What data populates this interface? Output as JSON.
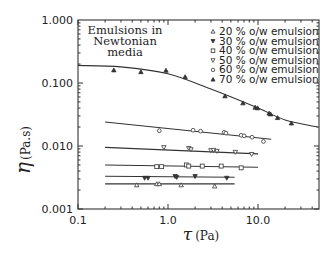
{
  "chart_data": {
    "type": "scatter",
    "title": "",
    "annotation": [
      "Emulsions in",
      "Newtonian",
      "media"
    ],
    "xlabel": "τ (Pa)",
    "ylabel": "η (Pa.s)",
    "xscale": "log",
    "yscale": "log",
    "xlim": [
      0.1,
      46
    ],
    "ylim": [
      0.001,
      1.0
    ],
    "xticks": [
      "0.1",
      "1.0",
      "10.0"
    ],
    "yticks": [
      "1.000",
      "0.100",
      "0.010",
      "0.001"
    ],
    "grid": false,
    "legend_position": "upper right",
    "series": [
      {
        "name": "20 % o/w emulsion",
        "marker": "triangle-open",
        "x": [
          0.45,
          0.75,
          0.8,
          1.4,
          3.3
        ],
        "y": [
          0.0024,
          0.0025,
          0.0025,
          0.0024,
          0.0023
        ],
        "fit": {
          "x": [
            0.2,
            5.5
          ],
          "y": [
            0.0025,
            0.0025
          ]
        }
      },
      {
        "name": "30 % o/w emulsion",
        "marker": "triangle-down-filled",
        "x": [
          0.55,
          0.6,
          1.2,
          1.25,
          2.0,
          4.5
        ],
        "y": [
          0.0031,
          0.0031,
          0.0033,
          0.0032,
          0.0033,
          0.0031
        ],
        "fit": {
          "x": [
            0.2,
            5.5
          ],
          "y": [
            0.0033,
            0.0032
          ]
        }
      },
      {
        "name": "40 % o/w emulsion",
        "marker": "square-open",
        "x": [
          0.75,
          0.85,
          1.6,
          1.7,
          2.4,
          3.9,
          6.5
        ],
        "y": [
          0.0047,
          0.0047,
          0.005,
          0.0048,
          0.0048,
          0.0048,
          0.0045
        ],
        "fit": {
          "x": [
            0.2,
            10
          ],
          "y": [
            0.005,
            0.0046
          ]
        }
      },
      {
        "name": "50 % o/w emulsion",
        "marker": "triangle-down-open",
        "x": [
          0.9,
          1.7,
          1.8,
          3.0,
          3.2,
          3.5,
          5.6,
          8.5
        ],
        "y": [
          0.0095,
          0.0092,
          0.0088,
          0.0085,
          0.0086,
          0.0083,
          0.008,
          0.0074
        ],
        "fit": {
          "x": [
            0.2,
            10
          ],
          "y": [
            0.0095,
            0.0075
          ]
        }
      },
      {
        "name": "60 % o/w emulsion",
        "marker": "circle-open",
        "x": [
          0.8,
          1.9,
          2.3,
          4.2,
          4.4,
          6.5,
          7.0,
          8.6,
          11.5
        ],
        "y": [
          0.0175,
          0.0178,
          0.0172,
          0.0165,
          0.016,
          0.0148,
          0.0145,
          0.0138,
          0.0118
        ],
        "fit": {
          "x": [
            0.2,
            14
          ],
          "y": [
            0.024,
            0.0128
          ]
        }
      },
      {
        "name": "70 % o/w emulsion",
        "marker": "triangle-filled",
        "x": [
          0.25,
          0.5,
          0.95,
          1.55,
          4.3,
          6.8,
          9.3,
          9.9,
          13.3,
          13.8,
          16.5,
          23.5
        ],
        "y": [
          0.16,
          0.15,
          0.158,
          0.125,
          0.062,
          0.048,
          0.041,
          0.04,
          0.033,
          0.032,
          0.028,
          0.023
        ],
        "fit": {
          "x": [
            0.1,
            0.3,
            1.0,
            3.0,
            10.0,
            20.0,
            46.0
          ],
          "y": [
            0.19,
            0.18,
            0.14,
            0.08,
            0.04,
            0.026,
            0.02
          ]
        }
      }
    ]
  }
}
